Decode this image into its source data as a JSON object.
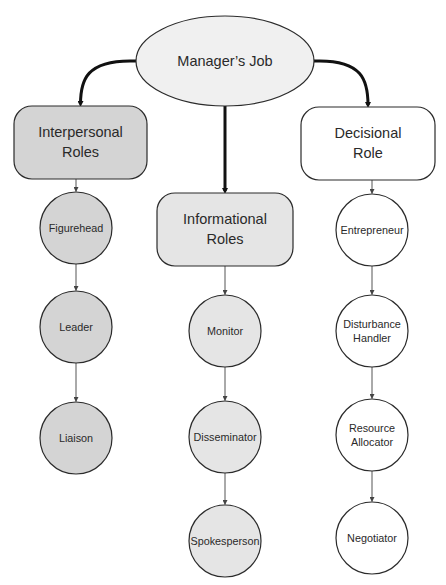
{
  "diagram": {
    "root": {
      "label": "Manager’s Job",
      "fill": "#f0f0f0",
      "cx": 225,
      "cy": 61,
      "rx": 89,
      "ry": 45
    },
    "categories": [
      {
        "id": "interpersonal",
        "label": "Interpersonal\nRoles",
        "fill": "#d4d4d4",
        "x": 14,
        "y": 106,
        "w": 133,
        "h": 73,
        "children": [
          {
            "label": "Figurehead",
            "cx": 76,
            "cy": 228
          },
          {
            "label": "Leader",
            "cx": 76,
            "cy": 327
          },
          {
            "label": "Liaison",
            "cx": 76,
            "cy": 438
          }
        ]
      },
      {
        "id": "informational",
        "label": "Informational\nRoles",
        "fill": "#e5e5e5",
        "x": 157,
        "y": 193,
        "w": 136,
        "h": 73,
        "children": [
          {
            "label": "Monitor",
            "cx": 225,
            "cy": 331
          },
          {
            "label": "Disseminator",
            "cx": 225,
            "cy": 437
          },
          {
            "label": "Spokesperson",
            "cx": 225,
            "cy": 541
          }
        ]
      },
      {
        "id": "decisional",
        "label": "Decisional\nRole",
        "fill": "#ffffff",
        "x": 301,
        "y": 107,
        "w": 134,
        "h": 73,
        "children": [
          {
            "label": "Entrepreneur",
            "cx": 372,
            "cy": 230
          },
          {
            "label": "Disturbance\nHandler",
            "cx": 372,
            "cy": 331
          },
          {
            "label": "Resource\nAllocator",
            "cx": 372,
            "cy": 435
          },
          {
            "label": "Negotiator",
            "cx": 372,
            "cy": 538
          }
        ]
      }
    ],
    "node_radius": 36,
    "stroke_color": "#2b2b2b",
    "thin_arrow_color": "#555555"
  }
}
